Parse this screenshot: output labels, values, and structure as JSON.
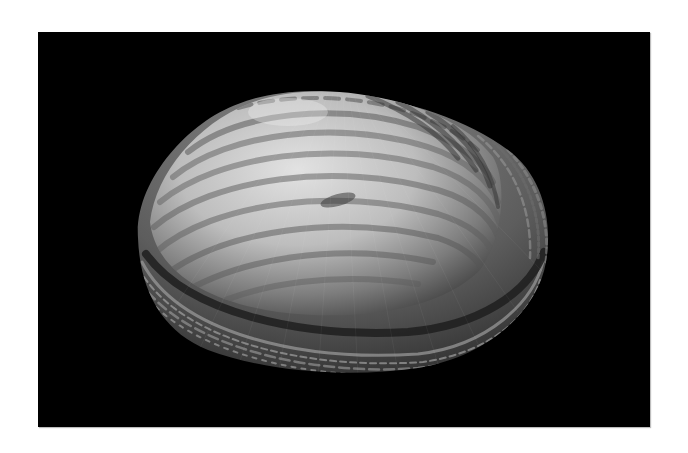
{
  "image": {
    "subject": "clam shell",
    "style": "grayscale photograph",
    "background_color": "#000000",
    "margin_color": "#ffffff",
    "colors": {
      "shell_light": "#d9d9d9",
      "shell_mid": "#9a9a9a",
      "shell_dark": "#3a3a3a",
      "band_dark": "#222222"
    }
  }
}
